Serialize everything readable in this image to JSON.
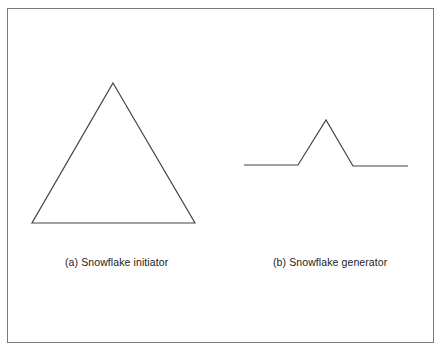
{
  "figure": {
    "initiator": {
      "caption": "(a)  Snowflake initiator",
      "shape": "equilateral-triangle",
      "points": [
        [
          113,
          83
        ],
        [
          195,
          223
        ],
        [
          32,
          223
        ]
      ]
    },
    "generator": {
      "caption": "(b)  Snowflake generator",
      "shape": "koch-generator-polyline",
      "points": [
        [
          244,
          165
        ],
        [
          298,
          165
        ],
        [
          326,
          120
        ],
        [
          353,
          166
        ],
        [
          408,
          166
        ]
      ]
    },
    "colors": {
      "stroke": "#444444",
      "border": "#7a7a7a",
      "background": "#ffffff"
    }
  }
}
